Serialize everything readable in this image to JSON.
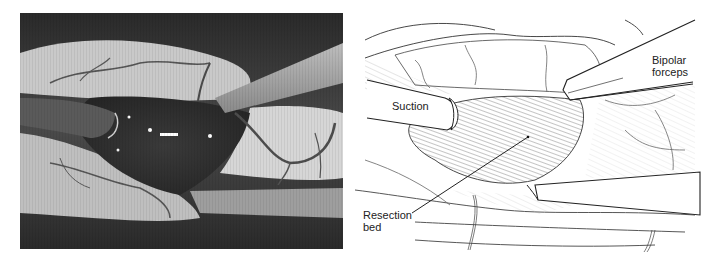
{
  "figure": {
    "left_panel": {
      "type": "intraoperative-photograph",
      "tone": "grayscale"
    },
    "right_panel": {
      "type": "line-illustration",
      "labels": {
        "suction": "Suction",
        "bipolar_line1": "Bipolar",
        "bipolar_line2": "forceps",
        "resection_line1": "Resection",
        "resection_line2": "bed"
      }
    }
  }
}
